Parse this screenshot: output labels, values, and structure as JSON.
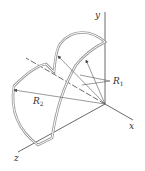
{
  "diagram": {
    "axes": {
      "x": "x",
      "y": "y",
      "z": "z"
    },
    "labels": {
      "r1": "R",
      "r1_sub": "1",
      "r2": "R",
      "r2_sub": "2"
    },
    "colors": {
      "line": "#444444",
      "shell_outer": "#9a9a9a",
      "shell_inner": "#ffffff"
    }
  }
}
